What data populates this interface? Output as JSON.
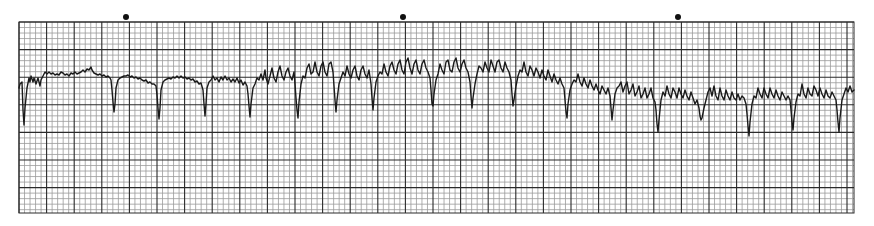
{
  "chart_data": {
    "type": "line",
    "title": "",
    "xlabel": "",
    "ylabel": "",
    "grid": true,
    "grid_spec": {
      "left": 19,
      "top": 22,
      "right": 854,
      "bottom": 213,
      "minor_px": 5.52,
      "major_every": 5,
      "minor_color": "#9a9a9a",
      "major_color": "#2a2a2a"
    },
    "timing_marks_x": [
      126,
      403,
      678
    ],
    "timing_mark_y": 17,
    "trace_color": "#1a1a1a",
    "trace_points": [
      [
        19,
        88
      ],
      [
        20,
        84
      ],
      [
        22,
        82
      ],
      [
        23,
        110
      ],
      [
        24,
        125
      ],
      [
        25,
        108
      ],
      [
        27,
        88
      ],
      [
        29,
        78
      ],
      [
        30,
        82
      ],
      [
        31,
        76
      ],
      [
        33,
        82
      ],
      [
        34,
        78
      ],
      [
        36,
        84
      ],
      [
        38,
        78
      ],
      [
        40,
        86
      ],
      [
        41,
        80
      ],
      [
        43,
        76
      ],
      [
        45,
        72
      ],
      [
        47,
        74
      ],
      [
        49,
        72
      ],
      [
        51,
        74
      ],
      [
        53,
        73
      ],
      [
        55,
        75
      ],
      [
        57,
        74
      ],
      [
        59,
        75
      ],
      [
        61,
        72
      ],
      [
        63,
        73
      ],
      [
        65,
        75
      ],
      [
        67,
        74
      ],
      [
        69,
        76
      ],
      [
        71,
        73
      ],
      [
        73,
        74
      ],
      [
        75,
        72
      ],
      [
        77,
        74
      ],
      [
        79,
        73
      ],
      [
        81,
        72
      ],
      [
        83,
        70
      ],
      [
        85,
        72
      ],
      [
        87,
        69
      ],
      [
        89,
        70
      ],
      [
        91,
        67
      ],
      [
        92,
        70
      ],
      [
        94,
        73
      ],
      [
        96,
        74
      ],
      [
        98,
        75
      ],
      [
        100,
        74
      ],
      [
        102,
        76
      ],
      [
        104,
        75
      ],
      [
        106,
        77
      ],
      [
        108,
        76
      ],
      [
        110,
        78
      ],
      [
        111,
        80
      ],
      [
        112,
        90
      ],
      [
        113,
        102
      ],
      [
        114,
        112
      ],
      [
        115,
        104
      ],
      [
        116,
        88
      ],
      [
        118,
        80
      ],
      [
        120,
        78
      ],
      [
        122,
        77
      ],
      [
        124,
        76
      ],
      [
        126,
        76
      ],
      [
        128,
        75
      ],
      [
        130,
        77
      ],
      [
        132,
        76
      ],
      [
        134,
        78
      ],
      [
        136,
        77
      ],
      [
        138,
        79
      ],
      [
        140,
        78
      ],
      [
        142,
        80
      ],
      [
        144,
        81
      ],
      [
        146,
        80
      ],
      [
        148,
        83
      ],
      [
        150,
        82
      ],
      [
        152,
        84
      ],
      [
        154,
        84
      ],
      [
        156,
        86
      ],
      [
        157,
        95
      ],
      [
        158,
        108
      ],
      [
        159,
        119
      ],
      [
        160,
        108
      ],
      [
        161,
        90
      ],
      [
        163,
        82
      ],
      [
        165,
        80
      ],
      [
        167,
        79
      ],
      [
        169,
        78
      ],
      [
        171,
        79
      ],
      [
        173,
        77
      ],
      [
        175,
        78
      ],
      [
        177,
        76
      ],
      [
        179,
        78
      ],
      [
        181,
        76
      ],
      [
        183,
        78
      ],
      [
        185,
        77
      ],
      [
        187,
        79
      ],
      [
        189,
        78
      ],
      [
        191,
        80
      ],
      [
        193,
        79
      ],
      [
        195,
        82
      ],
      [
        197,
        81
      ],
      [
        199,
        84
      ],
      [
        201,
        83
      ],
      [
        203,
        90
      ],
      [
        204,
        104
      ],
      [
        205,
        116
      ],
      [
        206,
        104
      ],
      [
        207,
        88
      ],
      [
        209,
        82
      ],
      [
        211,
        80
      ],
      [
        213,
        76
      ],
      [
        215,
        80
      ],
      [
        217,
        78
      ],
      [
        219,
        82
      ],
      [
        221,
        77
      ],
      [
        223,
        80
      ],
      [
        225,
        76
      ],
      [
        227,
        80
      ],
      [
        229,
        78
      ],
      [
        231,
        82
      ],
      [
        233,
        79
      ],
      [
        235,
        82
      ],
      [
        237,
        78
      ],
      [
        239,
        83
      ],
      [
        241,
        80
      ],
      [
        243,
        85
      ],
      [
        245,
        82
      ],
      [
        247,
        86
      ],
      [
        248,
        94
      ],
      [
        249,
        106
      ],
      [
        250,
        117
      ],
      [
        251,
        104
      ],
      [
        253,
        88
      ],
      [
        255,
        84
      ],
      [
        257,
        78
      ],
      [
        259,
        80
      ],
      [
        261,
        74
      ],
      [
        263,
        80
      ],
      [
        265,
        70
      ],
      [
        266,
        78
      ],
      [
        268,
        84
      ],
      [
        270,
        76
      ],
      [
        272,
        68
      ],
      [
        274,
        78
      ],
      [
        276,
        82
      ],
      [
        278,
        72
      ],
      [
        280,
        66
      ],
      [
        282,
        76
      ],
      [
        284,
        80
      ],
      [
        286,
        72
      ],
      [
        288,
        68
      ],
      [
        290,
        76
      ],
      [
        292,
        80
      ],
      [
        294,
        72
      ],
      [
        295,
        84
      ],
      [
        296,
        98
      ],
      [
        297,
        110
      ],
      [
        298,
        118
      ],
      [
        299,
        102
      ],
      [
        301,
        84
      ],
      [
        303,
        76
      ],
      [
        305,
        78
      ],
      [
        307,
        68
      ],
      [
        309,
        64
      ],
      [
        311,
        74
      ],
      [
        313,
        72
      ],
      [
        315,
        62
      ],
      [
        317,
        72
      ],
      [
        319,
        76
      ],
      [
        321,
        66
      ],
      [
        323,
        62
      ],
      [
        325,
        72
      ],
      [
        327,
        76
      ],
      [
        329,
        64
      ],
      [
        331,
        62
      ],
      [
        333,
        72
      ],
      [
        334,
        86
      ],
      [
        335,
        100
      ],
      [
        336,
        112
      ],
      [
        337,
        100
      ],
      [
        339,
        84
      ],
      [
        341,
        78
      ],
      [
        343,
        72
      ],
      [
        345,
        76
      ],
      [
        347,
        66
      ],
      [
        349,
        74
      ],
      [
        351,
        78
      ],
      [
        353,
        70
      ],
      [
        355,
        66
      ],
      [
        357,
        76
      ],
      [
        359,
        80
      ],
      [
        361,
        70
      ],
      [
        363,
        66
      ],
      [
        365,
        74
      ],
      [
        367,
        78
      ],
      [
        369,
        70
      ],
      [
        371,
        84
      ],
      [
        372,
        98
      ],
      [
        373,
        110
      ],
      [
        374,
        98
      ],
      [
        376,
        82
      ],
      [
        378,
        76
      ],
      [
        380,
        72
      ],
      [
        382,
        74
      ],
      [
        384,
        64
      ],
      [
        386,
        72
      ],
      [
        388,
        76
      ],
      [
        390,
        66
      ],
      [
        392,
        62
      ],
      [
        394,
        70
      ],
      [
        396,
        74
      ],
      [
        398,
        64
      ],
      [
        400,
        60
      ],
      [
        402,
        70
      ],
      [
        404,
        74
      ],
      [
        406,
        62
      ],
      [
        408,
        58
      ],
      [
        410,
        68
      ],
      [
        412,
        74
      ],
      [
        414,
        64
      ],
      [
        416,
        60
      ],
      [
        418,
        70
      ],
      [
        420,
        74
      ],
      [
        422,
        64
      ],
      [
        424,
        60
      ],
      [
        426,
        68
      ],
      [
        428,
        72
      ],
      [
        430,
        78
      ],
      [
        431,
        90
      ],
      [
        432,
        104
      ],
      [
        433,
        106
      ],
      [
        434,
        94
      ],
      [
        436,
        80
      ],
      [
        438,
        74
      ],
      [
        440,
        64
      ],
      [
        442,
        70
      ],
      [
        444,
        74
      ],
      [
        446,
        62
      ],
      [
        448,
        60
      ],
      [
        450,
        70
      ],
      [
        452,
        72
      ],
      [
        454,
        62
      ],
      [
        456,
        58
      ],
      [
        458,
        68
      ],
      [
        460,
        72
      ],
      [
        462,
        64
      ],
      [
        464,
        60
      ],
      [
        466,
        68
      ],
      [
        468,
        72
      ],
      [
        470,
        82
      ],
      [
        471,
        96
      ],
      [
        472,
        108
      ],
      [
        473,
        98
      ],
      [
        475,
        84
      ],
      [
        477,
        74
      ],
      [
        479,
        66
      ],
      [
        481,
        68
      ],
      [
        483,
        72
      ],
      [
        485,
        62
      ],
      [
        487,
        68
      ],
      [
        489,
        72
      ],
      [
        491,
        60
      ],
      [
        493,
        66
      ],
      [
        495,
        72
      ],
      [
        497,
        62
      ],
      [
        499,
        60
      ],
      [
        501,
        68
      ],
      [
        503,
        72
      ],
      [
        505,
        62
      ],
      [
        507,
        68
      ],
      [
        509,
        72
      ],
      [
        511,
        80
      ],
      [
        512,
        94
      ],
      [
        513,
        106
      ],
      [
        514,
        100
      ],
      [
        516,
        86
      ],
      [
        518,
        76
      ],
      [
        520,
        70
      ],
      [
        522,
        72
      ],
      [
        524,
        62
      ],
      [
        526,
        72
      ],
      [
        528,
        76
      ],
      [
        530,
        66
      ],
      [
        532,
        70
      ],
      [
        534,
        76
      ],
      [
        536,
        68
      ],
      [
        538,
        72
      ],
      [
        540,
        78
      ],
      [
        542,
        70
      ],
      [
        544,
        76
      ],
      [
        546,
        80
      ],
      [
        548,
        70
      ],
      [
        550,
        76
      ],
      [
        552,
        82
      ],
      [
        554,
        74
      ],
      [
        556,
        80
      ],
      [
        558,
        84
      ],
      [
        560,
        78
      ],
      [
        562,
        84
      ],
      [
        564,
        88
      ],
      [
        565,
        100
      ],
      [
        566,
        112
      ],
      [
        567,
        118
      ],
      [
        568,
        104
      ],
      [
        570,
        90
      ],
      [
        572,
        84
      ],
      [
        574,
        80
      ],
      [
        576,
        82
      ],
      [
        578,
        74
      ],
      [
        580,
        82
      ],
      [
        582,
        86
      ],
      [
        584,
        78
      ],
      [
        586,
        84
      ],
      [
        588,
        88
      ],
      [
        590,
        80
      ],
      [
        592,
        86
      ],
      [
        594,
        90
      ],
      [
        596,
        84
      ],
      [
        598,
        90
      ],
      [
        600,
        94
      ],
      [
        602,
        86
      ],
      [
        604,
        90
      ],
      [
        606,
        94
      ],
      [
        608,
        88
      ],
      [
        610,
        96
      ],
      [
        611,
        108
      ],
      [
        612,
        120
      ],
      [
        613,
        110
      ],
      [
        615,
        94
      ],
      [
        617,
        88
      ],
      [
        619,
        86
      ],
      [
        621,
        82
      ],
      [
        623,
        92
      ],
      [
        625,
        86
      ],
      [
        627,
        82
      ],
      [
        629,
        94
      ],
      [
        631,
        90
      ],
      [
        633,
        84
      ],
      [
        635,
        96
      ],
      [
        637,
        92
      ],
      [
        639,
        86
      ],
      [
        641,
        98
      ],
      [
        643,
        94
      ],
      [
        645,
        88
      ],
      [
        647,
        98
      ],
      [
        649,
        94
      ],
      [
        651,
        88
      ],
      [
        653,
        98
      ],
      [
        655,
        102
      ],
      [
        656,
        110
      ],
      [
        657,
        124
      ],
      [
        658,
        132
      ],
      [
        659,
        120
      ],
      [
        661,
        100
      ],
      [
        663,
        92
      ],
      [
        665,
        96
      ],
      [
        667,
        86
      ],
      [
        669,
        94
      ],
      [
        671,
        98
      ],
      [
        673,
        88
      ],
      [
        675,
        92
      ],
      [
        677,
        98
      ],
      [
        679,
        88
      ],
      [
        681,
        94
      ],
      [
        683,
        98
      ],
      [
        685,
        90
      ],
      [
        687,
        96
      ],
      [
        689,
        100
      ],
      [
        691,
        92
      ],
      [
        693,
        98
      ],
      [
        695,
        104
      ],
      [
        697,
        100
      ],
      [
        699,
        108
      ],
      [
        700,
        116
      ],
      [
        701,
        120
      ],
      [
        702,
        118
      ],
      [
        704,
        108
      ],
      [
        706,
        100
      ],
      [
        708,
        92
      ],
      [
        710,
        88
      ],
      [
        712,
        96
      ],
      [
        714,
        86
      ],
      [
        716,
        96
      ],
      [
        718,
        100
      ],
      [
        720,
        88
      ],
      [
        722,
        96
      ],
      [
        724,
        100
      ],
      [
        726,
        90
      ],
      [
        728,
        96
      ],
      [
        730,
        100
      ],
      [
        732,
        92
      ],
      [
        734,
        98
      ],
      [
        736,
        100
      ],
      [
        738,
        94
      ],
      [
        740,
        100
      ],
      [
        742,
        96
      ],
      [
        744,
        98
      ],
      [
        746,
        104
      ],
      [
        747,
        114
      ],
      [
        748,
        126
      ],
      [
        749,
        136
      ],
      [
        750,
        122
      ],
      [
        752,
        104
      ],
      [
        754,
        96
      ],
      [
        756,
        98
      ],
      [
        758,
        88
      ],
      [
        760,
        94
      ],
      [
        762,
        98
      ],
      [
        764,
        88
      ],
      [
        766,
        94
      ],
      [
        768,
        98
      ],
      [
        770,
        88
      ],
      [
        772,
        94
      ],
      [
        774,
        98
      ],
      [
        776,
        90
      ],
      [
        778,
        96
      ],
      [
        780,
        100
      ],
      [
        782,
        92
      ],
      [
        784,
        96
      ],
      [
        786,
        100
      ],
      [
        788,
        96
      ],
      [
        790,
        100
      ],
      [
        791,
        110
      ],
      [
        792,
        122
      ],
      [
        793,
        130
      ],
      [
        794,
        118
      ],
      [
        796,
        102
      ],
      [
        798,
        94
      ],
      [
        800,
        96
      ],
      [
        802,
        84
      ],
      [
        804,
        94
      ],
      [
        806,
        98
      ],
      [
        808,
        88
      ],
      [
        810,
        94
      ],
      [
        812,
        96
      ],
      [
        814,
        86
      ],
      [
        816,
        90
      ],
      [
        818,
        96
      ],
      [
        820,
        88
      ],
      [
        822,
        94
      ],
      [
        824,
        98
      ],
      [
        826,
        90
      ],
      [
        828,
        96
      ],
      [
        830,
        98
      ],
      [
        832,
        92
      ],
      [
        834,
        96
      ],
      [
        836,
        100
      ],
      [
        837,
        110
      ],
      [
        838,
        122
      ],
      [
        839,
        132
      ],
      [
        840,
        118
      ],
      [
        842,
        100
      ],
      [
        844,
        94
      ],
      [
        846,
        88
      ],
      [
        848,
        92
      ],
      [
        850,
        86
      ],
      [
        852,
        92
      ],
      [
        854,
        90
      ]
    ]
  }
}
